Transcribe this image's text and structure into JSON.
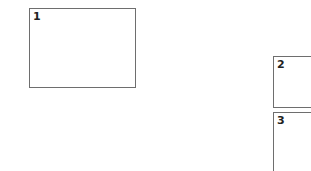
{
  "panels": [
    {
      "label": "1"
    },
    {
      "label": "2"
    },
    {
      "label": "3"
    }
  ],
  "colors": {
    "border": "#6e6e6e",
    "label": "#222222",
    "background": "#ffffff"
  }
}
